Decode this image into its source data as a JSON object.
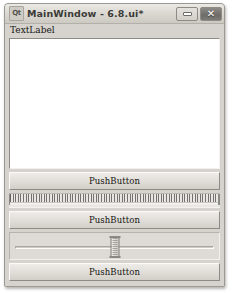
{
  "window": {
    "title": "MainWindow - 6.8.ui*",
    "app_icon": "qt-logo-icon",
    "app_icon_glyph": "Qt",
    "controls": {
      "minimize": {
        "name": "minimize-button",
        "icon": "minimize-icon",
        "label": ""
      },
      "close": {
        "name": "close-button",
        "icon": "close-icon",
        "glyph": "✕"
      }
    }
  },
  "central": {
    "text_label": "TextLabel",
    "text_edit": {
      "value": "",
      "placeholder": ""
    },
    "pushbutton_1": "PushButton",
    "tick_slider": {
      "name": "dial-tickmarks",
      "value": ""
    },
    "pushbutton_2": "PushButton",
    "slider": {
      "name": "horizontal-slider",
      "value": ""
    },
    "pushbutton_3": "PushButton"
  },
  "colors": {
    "window_face": "#d6d3ce",
    "titlebar_top": "#eceae6",
    "titlebar_bottom": "#cdcac3",
    "button_face": "#e2dfda",
    "text": "#14130f",
    "field_background": "#ffffff",
    "border_dark": "#8d8b86",
    "border_light": "#f3f1ee",
    "close_button": "#6e6c68"
  }
}
